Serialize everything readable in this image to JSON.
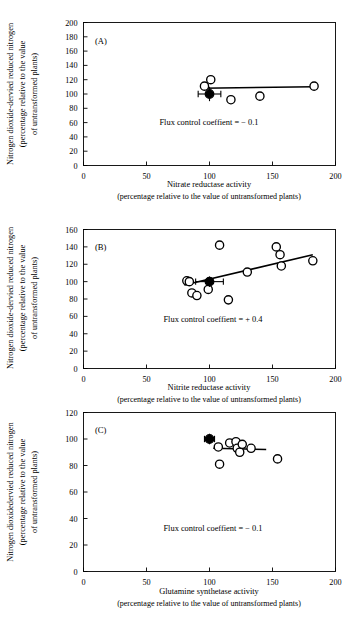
{
  "figure": {
    "panel_count": 3,
    "marker_legend": {
      "open_circle": "transformed plant lines",
      "filled_circle": "untransformed control (100%, 100%)"
    }
  },
  "chart_data": [
    {
      "type": "scatter",
      "panel_label": "(A)",
      "title": "",
      "xlabel": "Nitrate reductase activity",
      "xlabel_sub": "(percentage relative to the value of untransformed plants)",
      "ylabel": "Nitrogen dioxide-dervied reduced nitrogen",
      "ylabel_sub_1": "(percentage relative to the value",
      "ylabel_sub_2": "of untransformed plants)",
      "xlim": [
        0,
        200
      ],
      "ylim": [
        0,
        200
      ],
      "xticks": [
        0,
        50,
        100,
        150,
        200
      ],
      "yticks": [
        0,
        20,
        40,
        60,
        80,
        100,
        120,
        140,
        160,
        180,
        200
      ],
      "grid": false,
      "legend": "none",
      "annotation": "Flux control coeffient = − 0.1",
      "points_open": [
        {
          "x": 96,
          "y": 111
        },
        {
          "x": 101,
          "y": 120
        },
        {
          "x": 117,
          "y": 92
        },
        {
          "x": 140,
          "y": 97
        },
        {
          "x": 183,
          "y": 111
        }
      ],
      "points_filled": [
        {
          "x": 100,
          "y": 100,
          "xerr": 9,
          "yerr": 10
        }
      ],
      "fit_line": {
        "x1": 94,
        "y1": 108,
        "x2": 183,
        "y2": 110
      }
    },
    {
      "type": "scatter",
      "panel_label": "(B)",
      "title": "",
      "xlabel": "Nitrite reductase activity",
      "xlabel_sub": "(percentage relative to the value of untransformed plants)",
      "ylabel": "Nitrogen dioxide-dervied reduced nitrogen",
      "ylabel_sub_1": "(percentage relative to the value",
      "ylabel_sub_2": "of untransformed plants)",
      "xlim": [
        0,
        200
      ],
      "ylim": [
        0,
        160
      ],
      "xticks": [
        0,
        50,
        100,
        150,
        200
      ],
      "yticks": [
        0,
        20,
        40,
        60,
        80,
        100,
        120,
        140,
        160
      ],
      "grid": false,
      "legend": "none",
      "annotation": "Flux control coeffient = + 0.4",
      "points_open": [
        {
          "x": 82,
          "y": 101
        },
        {
          "x": 84,
          "y": 100
        },
        {
          "x": 86,
          "y": 87
        },
        {
          "x": 90,
          "y": 84
        },
        {
          "x": 99,
          "y": 91
        },
        {
          "x": 108,
          "y": 142
        },
        {
          "x": 115,
          "y": 79
        },
        {
          "x": 130,
          "y": 111
        },
        {
          "x": 153,
          "y": 140
        },
        {
          "x": 156,
          "y": 131
        },
        {
          "x": 157,
          "y": 118
        },
        {
          "x": 182,
          "y": 124
        }
      ],
      "points_filled": [
        {
          "x": 100,
          "y": 100,
          "xerr": 11,
          "yerr": 6
        }
      ],
      "fit_line": {
        "x1": 80,
        "y1": 96,
        "x2": 182,
        "y2": 131
      }
    },
    {
      "type": "scatter",
      "panel_label": "(C)",
      "title": "",
      "xlabel": "Glutamine synthetase activity",
      "xlabel_sub": "(percentage relative to the value of untransformed plants)",
      "ylabel": "Nitrogen dioxidedervied reduced nitrogen",
      "ylabel_sub_1": "(percentage relative to the value",
      "ylabel_sub_2": "of untransformed plants)",
      "xlim": [
        0,
        200
      ],
      "ylim": [
        0,
        120
      ],
      "xticks": [
        0,
        50,
        100,
        150,
        200
      ],
      "yticks": [
        0,
        20,
        40,
        60,
        80,
        100,
        120
      ],
      "grid": false,
      "legend": "none",
      "annotation": "Flux control coeffient = − 0.1",
      "points_open": [
        {
          "x": 107,
          "y": 94
        },
        {
          "x": 108,
          "y": 81
        },
        {
          "x": 116,
          "y": 97
        },
        {
          "x": 121,
          "y": 98
        },
        {
          "x": 122,
          "y": 93
        },
        {
          "x": 124,
          "y": 90
        },
        {
          "x": 126,
          "y": 96
        },
        {
          "x": 133,
          "y": 93
        },
        {
          "x": 154,
          "y": 85
        }
      ],
      "points_filled": [
        {
          "x": 100,
          "y": 100,
          "xerr": 4,
          "yerr": 4
        }
      ],
      "fit_line": {
        "x1": 103,
        "y1": 93,
        "x2": 145,
        "y2": 92
      }
    }
  ]
}
